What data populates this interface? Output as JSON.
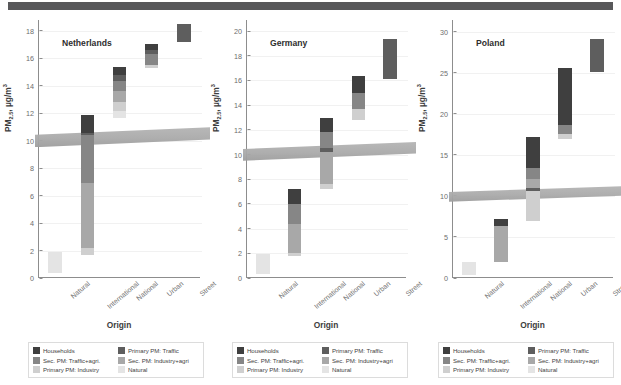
{
  "figure": {
    "title": "",
    "y_axis_label_main": "PM",
    "y_axis_label_sub": "2.5",
    "y_axis_label_unit": ", µg/m",
    "y_axis_label_sup": "3",
    "x_axis_label": "Origin",
    "guideline_band_label": "WHO guideline band",
    "guideline_value": 10
  },
  "legend": {
    "items": [
      {
        "label": "Households",
        "color": "#3f3f3f",
        "key": "households"
      },
      {
        "label": "Primary PM: Traffic",
        "color": "#5e5e5e",
        "key": "primary-traffic"
      },
      {
        "label": "Sec. PM: Traffic+agri.",
        "color": "#868686",
        "key": "sec-traffic-agri"
      },
      {
        "label": "Sec. PM: Industry+agri",
        "color": "#a8a8a8",
        "key": "sec-industry-agri"
      },
      {
        "label": "Primary PM: Industry",
        "color": "#cfcfcf",
        "key": "primary-industry"
      },
      {
        "label": "Natural",
        "color": "#e4e4e4",
        "key": "natural"
      }
    ],
    "order": [
      "households",
      "primary-traffic",
      "sec-traffic-agri",
      "sec-industry-agri",
      "primary-industry",
      "natural"
    ]
  },
  "colors": {
    "households": "#3f3f3f",
    "primary-traffic": "#5e5e5e",
    "sec-traffic-agri": "#868686",
    "sec-industry-agri": "#a8a8a8",
    "primary-industry": "#cfcfcf",
    "natural": "#e4e4e4",
    "axis": "#8d8d8d",
    "grid": "#f1f1f1",
    "band": "#a9a9a9",
    "top_band": "#58585a",
    "text": "#3d3d3d"
  },
  "chart_data": {
    "type": "bar",
    "subtype": "stacked-floating-bar",
    "xlabel": "Origin",
    "ylabel": "PM2.5, µg/m3",
    "grid": true,
    "legend_position": "bottom",
    "categories": [
      "Natural",
      "International",
      "National",
      "Urban",
      "Street"
    ],
    "annotations": [
      {
        "type": "hband",
        "label": "guideline",
        "y_from": 9.9,
        "y_to": 10.7
      }
    ],
    "panels": [
      {
        "name": "Netherlands",
        "ylim": [
          0,
          18.8
        ],
        "yticks": [
          0,
          2,
          4,
          6,
          8,
          10,
          12,
          14,
          16,
          18
        ],
        "bars": [
          {
            "category": "Natural",
            "base": 0.35,
            "top": 1.9,
            "segments": [
              {
                "key": "natural",
                "from": 0.35,
                "to": 1.9
              }
            ]
          },
          {
            "category": "International",
            "base": 1.7,
            "top": 11.85,
            "segments": [
              {
                "key": "primary-industry",
                "from": 1.7,
                "to": 2.2
              },
              {
                "key": "sec-industry-agri",
                "from": 2.2,
                "to": 6.9
              },
              {
                "key": "sec-traffic-agri",
                "from": 6.9,
                "to": 10.4
              },
              {
                "key": "primary-traffic",
                "from": 10.4,
                "to": 10.6
              },
              {
                "key": "households",
                "from": 10.6,
                "to": 11.85
              }
            ]
          },
          {
            "category": "National",
            "base": 11.65,
            "top": 15.4,
            "segments": [
              {
                "key": "natural",
                "from": 11.65,
                "to": 12.15
              },
              {
                "key": "primary-industry",
                "from": 12.15,
                "to": 12.8
              },
              {
                "key": "sec-industry-agri",
                "from": 12.8,
                "to": 13.6
              },
              {
                "key": "sec-traffic-agri",
                "from": 13.6,
                "to": 14.35
              },
              {
                "key": "primary-traffic",
                "from": 14.35,
                "to": 14.8
              },
              {
                "key": "households",
                "from": 14.8,
                "to": 15.4
              }
            ]
          },
          {
            "category": "Urban",
            "base": 15.3,
            "top": 17.05,
            "segments": [
              {
                "key": "primary-industry",
                "from": 15.3,
                "to": 15.55
              },
              {
                "key": "sec-traffic-agri",
                "from": 15.55,
                "to": 16.3
              },
              {
                "key": "primary-traffic",
                "from": 16.3,
                "to": 16.65
              },
              {
                "key": "households",
                "from": 16.65,
                "to": 17.05
              }
            ]
          },
          {
            "category": "Street",
            "base": 17.2,
            "top": 18.5,
            "segments": [
              {
                "key": "primary-traffic",
                "from": 17.2,
                "to": 18.5
              }
            ]
          }
        ]
      },
      {
        "name": "Germany",
        "ylim": [
          0,
          20.9
        ],
        "yticks": [
          0,
          2,
          4,
          6,
          8,
          10,
          12,
          14,
          16,
          18,
          20
        ],
        "bars": [
          {
            "category": "Natural",
            "base": 0.35,
            "top": 1.95,
            "segments": [
              {
                "key": "natural",
                "from": 0.35,
                "to": 1.95
              }
            ]
          },
          {
            "category": "International",
            "base": 1.8,
            "top": 7.25,
            "segments": [
              {
                "key": "primary-industry",
                "from": 1.8,
                "to": 2.0
              },
              {
                "key": "sec-industry-agri",
                "from": 2.0,
                "to": 4.4
              },
              {
                "key": "sec-traffic-agri",
                "from": 4.4,
                "to": 6.0
              },
              {
                "key": "households",
                "from": 6.0,
                "to": 7.25
              }
            ]
          },
          {
            "category": "National",
            "base": 7.2,
            "top": 13.0,
            "segments": [
              {
                "key": "primary-industry",
                "from": 7.2,
                "to": 7.6
              },
              {
                "key": "sec-industry-agri",
                "from": 7.6,
                "to": 10.2
              },
              {
                "key": "primary-traffic",
                "from": 10.2,
                "to": 10.55
              },
              {
                "key": "sec-traffic-agri",
                "from": 10.55,
                "to": 11.85
              },
              {
                "key": "households",
                "from": 11.85,
                "to": 13.0
              }
            ]
          },
          {
            "category": "Urban",
            "base": 12.8,
            "top": 16.35,
            "segments": [
              {
                "key": "primary-industry",
                "from": 12.8,
                "to": 13.7
              },
              {
                "key": "sec-traffic-agri",
                "from": 13.7,
                "to": 15.0
              },
              {
                "key": "households",
                "from": 15.0,
                "to": 16.35
              }
            ]
          },
          {
            "category": "Street",
            "base": 16.15,
            "top": 19.4,
            "segments": [
              {
                "key": "primary-traffic",
                "from": 16.15,
                "to": 19.4
              }
            ]
          }
        ]
      },
      {
        "name": "Poland",
        "ylim": [
          0,
          31.4
        ],
        "yticks": [
          0,
          5,
          10,
          15,
          20,
          25,
          30
        ],
        "bars": [
          {
            "category": "Natural",
            "base": 0.4,
            "top": 2.0,
            "segments": [
              {
                "key": "natural",
                "from": 0.4,
                "to": 2.0
              }
            ]
          },
          {
            "category": "International",
            "base": 1.9,
            "top": 7.2,
            "segments": [
              {
                "key": "sec-industry-agri",
                "from": 1.9,
                "to": 6.3
              },
              {
                "key": "households",
                "from": 6.3,
                "to": 7.2
              }
            ]
          },
          {
            "category": "National",
            "base": 6.9,
            "top": 17.1,
            "segments": [
              {
                "key": "primary-industry",
                "from": 6.9,
                "to": 10.6
              },
              {
                "key": "primary-traffic",
                "from": 10.6,
                "to": 10.9
              },
              {
                "key": "sec-industry-agri",
                "from": 10.9,
                "to": 12.1
              },
              {
                "key": "sec-traffic-agri",
                "from": 12.1,
                "to": 13.4
              },
              {
                "key": "households",
                "from": 13.4,
                "to": 17.1
              }
            ]
          },
          {
            "category": "Urban",
            "base": 16.9,
            "top": 25.6,
            "segments": [
              {
                "key": "primary-industry",
                "from": 16.9,
                "to": 17.5
              },
              {
                "key": "sec-traffic-agri",
                "from": 17.5,
                "to": 18.6
              },
              {
                "key": "households",
                "from": 18.6,
                "to": 25.6
              }
            ]
          },
          {
            "category": "Street",
            "base": 25.1,
            "top": 29.1,
            "segments": [
              {
                "key": "primary-traffic",
                "from": 25.1,
                "to": 29.1
              }
            ]
          }
        ]
      }
    ]
  }
}
